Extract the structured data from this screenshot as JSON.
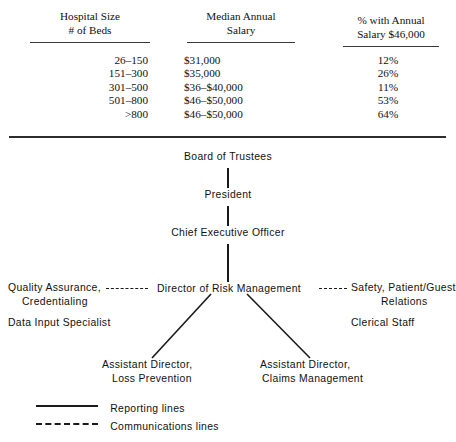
{
  "table": {
    "columns": [
      {
        "id": "beds",
        "header_line1": "Hospital Size",
        "header_line2": "# of Beds"
      },
      {
        "id": "salary",
        "header_line1": "Median Annual",
        "header_line2": "Salary"
      },
      {
        "id": "pct",
        "header_line1": "% with Annual",
        "header_line2": "Salary $46,000"
      }
    ],
    "rows": [
      {
        "beds": "26–150",
        "salary": "$31,000",
        "pct": "12%"
      },
      {
        "beds": "151–300",
        "salary": "$35,000",
        "pct": "26%"
      },
      {
        "beds": "301–500",
        "salary": "$36–$40,000",
        "pct": "11%"
      },
      {
        "beds": "501–800",
        "salary": "$46–$50,000",
        "pct": "53%"
      },
      {
        "beds": ">800",
        "salary": "$46–$50,000",
        "pct": "64%"
      }
    ]
  },
  "org_chart": {
    "board": "Board of Trustees",
    "president": "President",
    "ceo": "Chief Executive Officer",
    "director": "Director of Risk Management",
    "left_comm_line1": "Quality Assurance,",
    "left_comm_line2": "Credentialing",
    "left_extra": "Data Input Specialist",
    "right_comm_line1": "Safety, Patient/Guest",
    "right_comm_line2": "Relations",
    "right_extra": "Clerical Staff",
    "asst_left_line1": "Assistant Director,",
    "asst_left_line2": "Loss Prevention",
    "asst_right_line1": "Assistant Director,",
    "asst_right_line2": "Claims Management"
  },
  "legend": {
    "reporting": "Reporting lines",
    "communications": "Communications lines"
  },
  "colors": {
    "ink": "#1a1a1a",
    "rule": "#2c2c2c",
    "paper": "#ffffff"
  }
}
